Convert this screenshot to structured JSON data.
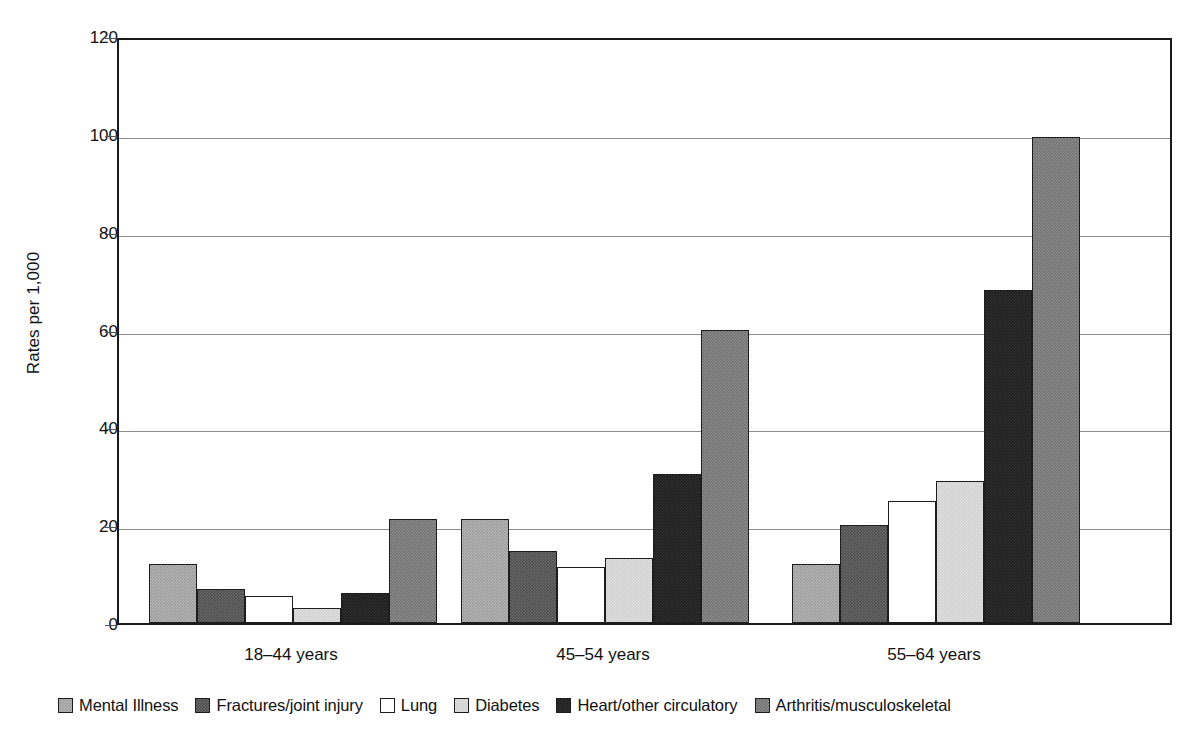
{
  "chart_data": {
    "type": "bar",
    "title": "",
    "xlabel": "",
    "ylabel": "Rates per 1,000",
    "ylim": [
      0,
      120
    ],
    "yticks": [
      0,
      20,
      40,
      60,
      80,
      100,
      120
    ],
    "ytick_labels": [
      "0",
      "20",
      "40",
      "60",
      "80",
      "100",
      "120"
    ],
    "grid": "horizontal",
    "legend_position": "bottom",
    "categories": [
      "18–44 years",
      "45–54 years",
      "55–64 years"
    ],
    "series": [
      {
        "name": "Mental Illness",
        "color": "#9c9c9c",
        "values": [
          12.0,
          21.3,
          12.0
        ]
      },
      {
        "name": "Fractures/joint injury",
        "color": "#4d4d4d",
        "values": [
          7.0,
          14.7,
          20.1
        ]
      },
      {
        "name": "Lung",
        "color": "#ffffff",
        "values": [
          5.5,
          11.5,
          24.9
        ]
      },
      {
        "name": "Diabetes",
        "color": "#cfcfcf",
        "values": [
          3.1,
          13.2,
          29.0
        ]
      },
      {
        "name": "Heart/other circulatory",
        "color": "#1c1c1c",
        "values": [
          6.1,
          30.4,
          68.0
        ]
      },
      {
        "name": "Arthritis/musculoskeletal",
        "color": "#717171",
        "values": [
          21.2,
          59.9,
          99.4
        ]
      }
    ]
  },
  "axis": {
    "y_title": "Rates per 1,000"
  },
  "legend": {
    "items": [
      {
        "label": "Mental Illness",
        "swatch": "legend-swatch-mental-illness"
      },
      {
        "label": "Fractures/joint injury",
        "swatch": "legend-swatch-fractures"
      },
      {
        "label": "Lung",
        "swatch": "legend-swatch-lung"
      },
      {
        "label": "Diabetes",
        "swatch": "legend-swatch-diabetes"
      },
      {
        "label": "Heart/other circulatory",
        "swatch": "legend-swatch-heart"
      },
      {
        "label": "Arthritis/musculoskeletal",
        "swatch": "legend-swatch-arthritis"
      }
    ]
  }
}
